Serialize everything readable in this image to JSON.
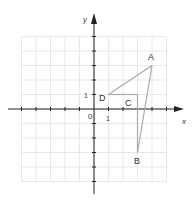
{
  "axes": {
    "x_label": "x",
    "y_label": "y",
    "origin_label": "0",
    "x_tick_label": "1",
    "y_tick_label": "1",
    "x_range": [
      -5,
      5
    ],
    "y_range": [
      -5,
      5
    ]
  },
  "points": [
    {
      "label": "A",
      "x": 4,
      "y": 3
    },
    {
      "label": "B",
      "x": 3,
      "y": -3
    },
    {
      "label": "C",
      "x": 3,
      "y": 1
    },
    {
      "label": "D",
      "x": 1,
      "y": 1
    }
  ],
  "segments": [
    [
      "D",
      "A"
    ],
    [
      "A",
      "B"
    ],
    [
      "D",
      "C"
    ],
    [
      "C",
      "B"
    ]
  ],
  "colors": {
    "grid": "#e2e2e2",
    "axis": "#222222",
    "shape": "#a8a8a8",
    "text": "#333333"
  }
}
